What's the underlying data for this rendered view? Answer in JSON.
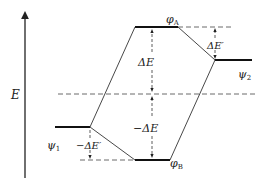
{
  "diagram": {
    "title": "",
    "axis": {
      "label": "E"
    },
    "levels": {
      "phi_A": {
        "symbol": "φ",
        "subscript": "A"
      },
      "phi_B": {
        "symbol": "φ",
        "subscript": "B"
      },
      "psi_1": {
        "symbol": "ψ",
        "subscript": "1"
      },
      "psi_2": {
        "symbol": "ψ",
        "subscript": "2"
      }
    },
    "annotations": {
      "delta_E": "ΔE",
      "minus_delta_E": "−ΔE",
      "delta_E_prime": "ΔE′",
      "minus_delta_E_prime": "−ΔE′"
    },
    "colors": {
      "line": "#222222",
      "background": "#ffffff"
    }
  }
}
